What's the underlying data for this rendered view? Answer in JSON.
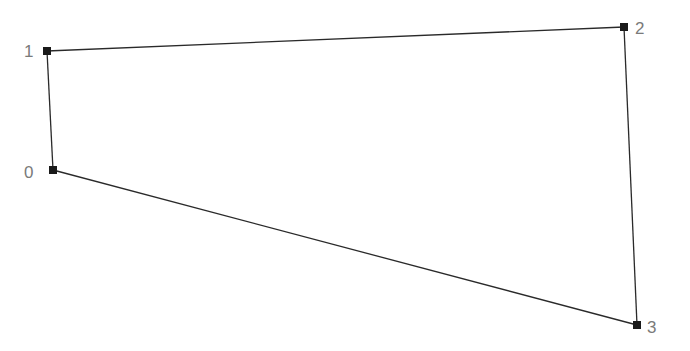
{
  "diagram": {
    "type": "quadrilateral",
    "width": 690,
    "height": 351,
    "colors": {
      "edge": "#2a2a2a",
      "marker": "#1a1a1a",
      "label": "#7a7a7a",
      "background": "#ffffff"
    },
    "marker_size": 8,
    "vertices": [
      {
        "id": 0,
        "label": "0",
        "x": 53,
        "y": 170,
        "label_x": 24,
        "label_y": 178
      },
      {
        "id": 1,
        "label": "1",
        "x": 47,
        "y": 51,
        "label_x": 24,
        "label_y": 57
      },
      {
        "id": 2,
        "label": "2",
        "x": 624,
        "y": 27,
        "label_x": 635,
        "label_y": 34
      },
      {
        "id": 3,
        "label": "3",
        "x": 637,
        "y": 325,
        "label_x": 647,
        "label_y": 333
      }
    ],
    "edges": [
      {
        "from": 0,
        "to": 1
      },
      {
        "from": 1,
        "to": 2
      },
      {
        "from": 2,
        "to": 3
      },
      {
        "from": 3,
        "to": 0
      }
    ]
  }
}
